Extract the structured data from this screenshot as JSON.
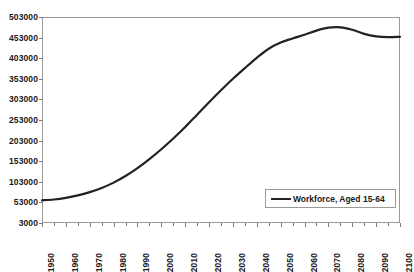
{
  "chart_data": {
    "type": "line",
    "title": "",
    "xlabel": "",
    "ylabel": "",
    "grid": false,
    "legend_position": "inside-bottom-right",
    "xlim": [
      1950,
      2100
    ],
    "ylim": [
      3000,
      503000
    ],
    "x_tick_labels": [
      "1950",
      "1960",
      "1970",
      "1980",
      "1990",
      "2000",
      "2010",
      "2020",
      "2030",
      "2040",
      "2050",
      "2060",
      "2070",
      "2080",
      "2090",
      "2100"
    ],
    "x_tick_values": [
      1950,
      1960,
      1970,
      1980,
      1990,
      2000,
      2010,
      2020,
      2030,
      2040,
      2050,
      2060,
      2070,
      2080,
      2090,
      2100
    ],
    "x_minor_tick_step": 5,
    "y_tick_labels": [
      "503000",
      "453000",
      "403000",
      "353000",
      "303000",
      "253000",
      "203000",
      "153000",
      "103000",
      "53000",
      "3000"
    ],
    "y_tick_values": [
      503000,
      453000,
      403000,
      353000,
      303000,
      253000,
      203000,
      153000,
      103000,
      53000,
      3000
    ],
    "series": [
      {
        "name": "Workforce, Aged 15-64",
        "color": "#222222",
        "x": [
          1950,
          1955,
          1960,
          1965,
          1970,
          1975,
          1980,
          1985,
          1990,
          1995,
          2000,
          2005,
          2010,
          2015,
          2020,
          2025,
          2030,
          2035,
          2040,
          2045,
          2050,
          2055,
          2060,
          2065,
          2070,
          2075,
          2080,
          2085,
          2090,
          2095,
          2100
        ],
        "values": [
          58000,
          60000,
          64000,
          70000,
          78000,
          88000,
          101000,
          117000,
          136000,
          158000,
          182000,
          208000,
          236000,
          266000,
          296000,
          325000,
          353000,
          379000,
          404000,
          426000,
          441000,
          451000,
          460000,
          470000,
          477000,
          478000,
          472000,
          462000,
          456000,
          454000,
          455000
        ]
      }
    ],
    "legend": [
      {
        "label": "Workforce, Aged 15-64",
        "color": "#222222"
      }
    ]
  },
  "axes": {
    "border_color": "#9a9a9a",
    "tick_color": "#7d7d7d",
    "text_color": "#1a1a1a"
  }
}
